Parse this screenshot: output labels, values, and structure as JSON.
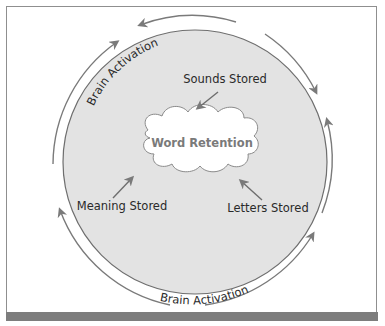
{
  "diagram": {
    "center": {
      "label": "Word Retention"
    },
    "inputs": [
      {
        "label": "Sounds Stored",
        "position": "top"
      },
      {
        "label": "Meaning Stored",
        "position": "bottom-left"
      },
      {
        "label": "Letters Stored",
        "position": "bottom-right"
      }
    ],
    "cycle_labels": [
      {
        "label": "Brain Activation",
        "position": "top-left"
      },
      {
        "label": "Brain Activation",
        "position": "bottom"
      }
    ],
    "colors": {
      "circle_fill": "#e3e3e3",
      "circle_stroke": "#6e6e6e",
      "arrow": "#7a7a7a",
      "cloud_fill": "#ffffff",
      "frame": "#8f8f8f",
      "bottom_bar": "#7d7d7d"
    }
  }
}
